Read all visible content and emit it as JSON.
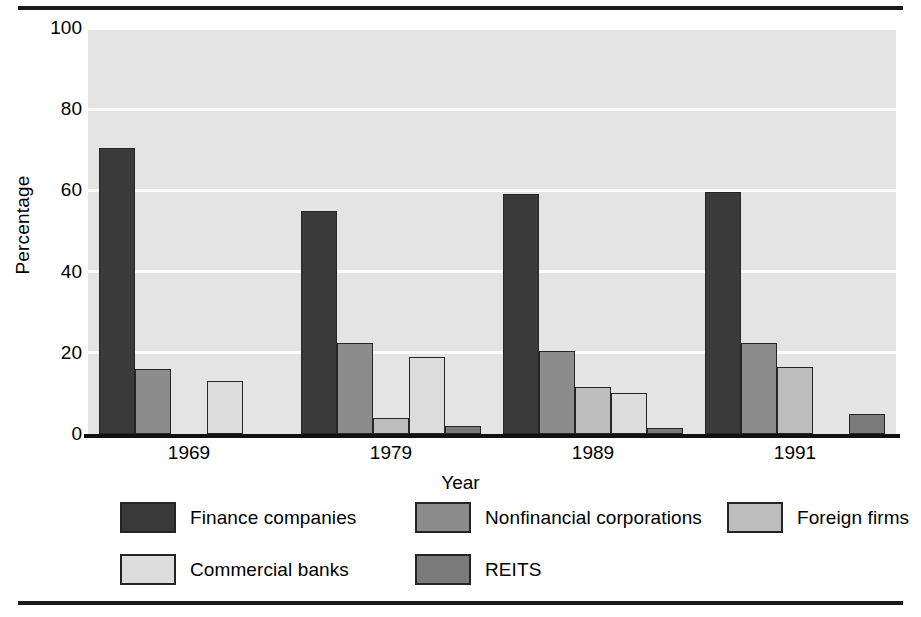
{
  "chart_data": {
    "type": "bar",
    "title": "",
    "xlabel": "Year",
    "ylabel": "Percentage",
    "categories": [
      "1969",
      "1979",
      "1989",
      "1991"
    ],
    "ylim": [
      0,
      100
    ],
    "yticks": [
      0,
      20,
      40,
      60,
      80,
      100
    ],
    "ytick_labels": [
      "0",
      "20",
      "40",
      "60",
      "80",
      "100"
    ],
    "grid": true,
    "legend_position": "below",
    "series": [
      {
        "name": "Finance companies",
        "color": "#3a3a3a",
        "values": [
          70.5,
          55.0,
          59.0,
          59.5
        ]
      },
      {
        "name": "Nonfinancial corporations",
        "color": "#8c8c8c",
        "values": [
          16.0,
          22.5,
          20.5,
          22.5
        ]
      },
      {
        "name": "Foreign firms",
        "color": "#bdbdbd",
        "values": [
          0,
          4.0,
          11.5,
          16.5
        ]
      },
      {
        "name": "Commercial banks",
        "color": "#dcdcdc",
        "values": [
          13.0,
          19.0,
          10.0,
          0
        ]
      },
      {
        "name": "REITS",
        "color": "#7a7a7a",
        "values": [
          0,
          2.0,
          1.5,
          5.0
        ]
      }
    ]
  },
  "legend": {
    "rows": [
      [
        "Finance companies",
        "Nonfinancial corporations",
        "Foreign firms"
      ],
      [
        "Commercial banks",
        "REITS"
      ]
    ]
  },
  "colors": {
    "plot_background": "#e4e4e4",
    "gridline": "#fdfdfd",
    "axis": "#111111",
    "rule": "#1a1a1a"
  }
}
